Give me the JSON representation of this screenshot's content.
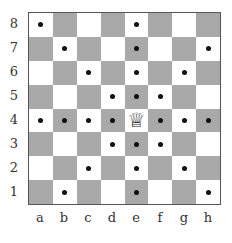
{
  "diagram": {
    "files": [
      "a",
      "b",
      "c",
      "d",
      "e",
      "f",
      "g",
      "h"
    ],
    "ranks": [
      "8",
      "7",
      "6",
      "5",
      "4",
      "3",
      "2",
      "1"
    ],
    "colors": {
      "light_square": "#ffffff",
      "dark_square": "#a9a9a9",
      "dot": "#111111"
    },
    "pieces": [
      {
        "square": "e4",
        "piece": "white-queen",
        "glyph": "♕"
      }
    ],
    "dots": [
      "a8",
      "e8",
      "b7",
      "e7",
      "h7",
      "c6",
      "e6",
      "g6",
      "d5",
      "e5",
      "f5",
      "a4",
      "b4",
      "c4",
      "d4",
      "f4",
      "g4",
      "h4",
      "d3",
      "e3",
      "f3",
      "c2",
      "e2",
      "g2",
      "b1",
      "e1",
      "h1"
    ]
  }
}
